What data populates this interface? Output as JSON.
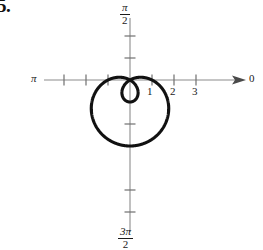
{
  "problem": {
    "number": "5."
  },
  "figure": {
    "caption_visible": false,
    "axis_labels": {
      "right": "0",
      "left": "π",
      "top_numerator": "π",
      "top_denominator": "2",
      "bottom_numerator": "3π",
      "bottom_denominator": "2"
    },
    "radial_tick_labels": [
      "1",
      "2",
      "3"
    ]
  },
  "colors": {
    "curve": "#111111",
    "axis": "#8c8c8c",
    "text": "#1a1a1a",
    "background": "#ffffff"
  },
  "chart_data": {
    "type": "line",
    "title": "",
    "subtitle": "",
    "plot_kind": "polar",
    "curve_name": "limacon-with-inner-loop",
    "equation": "r = 1 - 2 sin(theta)",
    "xlabel": "",
    "ylabel": "",
    "grid": false,
    "legend": null,
    "polar_axis_labels": {
      "theta_0": "0",
      "theta_pi_over_2": "π/2",
      "theta_pi": "π",
      "theta_3pi_over_2": "3π/2"
    },
    "radial_ticks": [
      1,
      2,
      3
    ],
    "radial_tick_labels": [
      "1",
      "2",
      "3"
    ],
    "negative_axis_ticks": [
      1,
      2,
      3,
      4
    ],
    "rmax": 3,
    "theta_units": "radians",
    "theta_range": [
      0,
      6.283185307179586
    ],
    "inner_loop_theta_range": [
      0.5235987755982988,
      2.6179938779914944
    ],
    "max_radius": 3,
    "points_note": "r(theta) sampled every 15 degrees, r = 1 - 2 sin(theta)",
    "theta_deg": [
      0,
      15,
      30,
      45,
      60,
      75,
      90,
      105,
      120,
      135,
      150,
      165,
      180,
      195,
      210,
      225,
      240,
      255,
      270,
      285,
      300,
      315,
      330,
      345,
      360
    ],
    "r_values": [
      1,
      0.482,
      0,
      -0.414,
      -0.732,
      -0.932,
      -1,
      -0.932,
      -0.732,
      -0.414,
      0,
      0.482,
      1,
      1.518,
      2,
      2.414,
      2.732,
      2.932,
      3,
      2.932,
      2.732,
      2.414,
      2,
      1.518,
      1
    ],
    "features": {
      "outer_loop_extreme_radius": 3,
      "outer_loop_extreme_theta_deg": 270,
      "inner_loop_extreme_radius": 1,
      "inner_loop_extreme_theta_deg": 90,
      "zeros_theta_deg": [
        30,
        150
      ]
    }
  }
}
